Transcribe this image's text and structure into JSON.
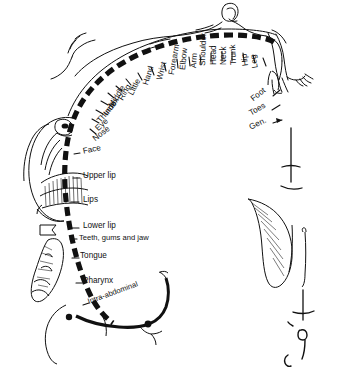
{
  "diagram": {
    "type": "anatomical-line-drawing",
    "background_color": "#ffffff",
    "ink_color": "#111111"
  },
  "labels": {
    "left_column": [
      {
        "text": "Face",
        "x": 83,
        "y": 152,
        "rot": -12
      },
      {
        "text": "Upper lip",
        "x": 83,
        "y": 176,
        "rot": 0
      },
      {
        "text": "Lips",
        "x": 83,
        "y": 200,
        "rot": 0
      },
      {
        "text": "Lower lip",
        "x": 83,
        "y": 226,
        "rot": 0
      },
      {
        "text": "Teeth, gums and jaw",
        "x": 79,
        "y": 238,
        "rot": 0
      },
      {
        "text": "Tongue",
        "x": 80,
        "y": 256,
        "rot": 0
      },
      {
        "text": "Pharynx",
        "x": 83,
        "y": 281,
        "rot": 0
      },
      {
        "text": "Intra-abdominal",
        "x": 88,
        "y": 302,
        "rot": -20
      }
    ],
    "upper_left_radial": [
      {
        "text": "Nose",
        "x": 94,
        "y": 140,
        "rot": -38
      },
      {
        "text": "Eye",
        "x": 97,
        "y": 130,
        "rot": -44
      },
      {
        "text": "Thumb",
        "x": 99,
        "y": 122,
        "rot": -50
      },
      {
        "text": "Index",
        "x": 106,
        "y": 115,
        "rot": -55
      },
      {
        "text": "Middle",
        "x": 111,
        "y": 107,
        "rot": -58
      },
      {
        "text": "Ring",
        "x": 121,
        "y": 100,
        "rot": -60
      },
      {
        "text": "Little",
        "x": 131,
        "y": 95,
        "rot": -63
      },
      {
        "text": "Hand",
        "x": 146,
        "y": 85,
        "rot": -73
      },
      {
        "text": "Wrist",
        "x": 160,
        "y": 80,
        "rot": -76
      },
      {
        "text": "Forearm",
        "x": 172,
        "y": 75,
        "rot": -80
      }
    ],
    "upper_right_radial": [
      {
        "text": "Elbow",
        "x": 183,
        "y": 70,
        "rot": -84
      },
      {
        "text": "Arm",
        "x": 194,
        "y": 68,
        "rot": -86
      },
      {
        "text": "Shoulder",
        "x": 203,
        "y": 66,
        "rot": -88
      },
      {
        "text": "Head",
        "x": 214,
        "y": 65,
        "rot": -90
      },
      {
        "text": "Neck",
        "x": 224,
        "y": 65,
        "rot": -90
      },
      {
        "text": "Trunk",
        "x": 234,
        "y": 65,
        "rot": -92
      },
      {
        "text": "Hip",
        "x": 246,
        "y": 66,
        "rot": -96
      },
      {
        "text": "Leg",
        "x": 256,
        "y": 68,
        "rot": -100
      }
    ],
    "lower_right_radial": [
      {
        "text": "Foot",
        "x": 252,
        "y": 100,
        "rot": -38
      },
      {
        "text": "Toes",
        "x": 250,
        "y": 114,
        "rot": -30
      },
      {
        "text": "Gen.",
        "x": 250,
        "y": 128,
        "rot": -26
      }
    ]
  }
}
